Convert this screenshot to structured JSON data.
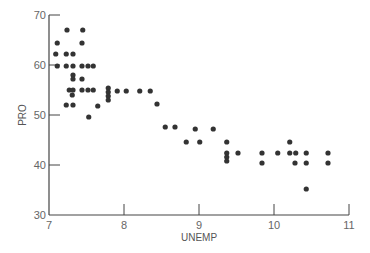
{
  "chart_data": {
    "type": "scatter",
    "title": "",
    "xlabel": "UNEMP",
    "ylabel": "PRO",
    "xlim": [
      7,
      11
    ],
    "ylim": [
      30,
      70
    ],
    "xticks": [
      7,
      8,
      9,
      10,
      11
    ],
    "yticks": [
      30,
      40,
      50,
      60,
      70
    ],
    "grid": false,
    "legend": null,
    "marker_color": "#333333",
    "axis_color": "#444444",
    "points": [
      [
        7.11,
        64.4
      ],
      [
        7.09,
        62.2
      ],
      [
        7.11,
        59.8
      ],
      [
        7.24,
        67.0
      ],
      [
        7.23,
        62.2
      ],
      [
        7.32,
        62.2
      ],
      [
        7.23,
        59.8
      ],
      [
        7.32,
        59.8
      ],
      [
        7.44,
        59.8
      ],
      [
        7.52,
        59.8
      ],
      [
        7.59,
        59.8
      ],
      [
        7.45,
        67.0
      ],
      [
        7.44,
        64.4
      ],
      [
        7.32,
        58.0
      ],
      [
        7.32,
        57.2
      ],
      [
        7.44,
        57.2
      ],
      [
        7.27,
        55.0
      ],
      [
        7.32,
        55.0
      ],
      [
        7.31,
        54.0
      ],
      [
        7.44,
        55.0
      ],
      [
        7.52,
        55.0
      ],
      [
        7.59,
        55.0
      ],
      [
        7.23,
        52.0
      ],
      [
        7.32,
        52.0
      ],
      [
        7.65,
        51.8
      ],
      [
        7.53,
        49.6
      ],
      [
        7.79,
        55.4
      ],
      [
        7.79,
        54.6
      ],
      [
        7.79,
        53.8
      ],
      [
        7.79,
        53.0
      ],
      [
        7.91,
        54.8
      ],
      [
        8.03,
        54.8
      ],
      [
        8.21,
        54.8
      ],
      [
        8.35,
        54.8
      ],
      [
        8.44,
        52.2
      ],
      [
        8.55,
        47.6
      ],
      [
        8.68,
        47.6
      ],
      [
        8.95,
        47.2
      ],
      [
        9.19,
        47.2
      ],
      [
        8.83,
        44.6
      ],
      [
        9.01,
        44.6
      ],
      [
        9.37,
        44.6
      ],
      [
        9.37,
        42.4
      ],
      [
        9.37,
        41.6
      ],
      [
        9.37,
        40.8
      ],
      [
        9.52,
        42.4
      ],
      [
        9.84,
        42.4
      ],
      [
        9.84,
        40.4
      ],
      [
        10.05,
        42.4
      ],
      [
        10.21,
        44.6
      ],
      [
        10.21,
        42.4
      ],
      [
        10.29,
        42.4
      ],
      [
        10.43,
        42.4
      ],
      [
        10.28,
        40.4
      ],
      [
        10.43,
        40.4
      ],
      [
        10.43,
        35.2
      ],
      [
        10.72,
        42.4
      ],
      [
        10.72,
        40.4
      ]
    ]
  },
  "labels": {
    "x_axis": "UNEMP",
    "y_axis": "PRO"
  }
}
